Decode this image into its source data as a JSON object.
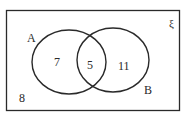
{
  "diagram": {
    "type": "venn",
    "universal_symbol": "ξ",
    "sets": [
      {
        "label": "A",
        "only_count": "7"
      },
      {
        "label": "B",
        "only_count": "11"
      }
    ],
    "intersection_count": "5",
    "outside_count": "8",
    "colors": {
      "stroke": "#2a2a2a",
      "background": "#ffffff"
    }
  }
}
